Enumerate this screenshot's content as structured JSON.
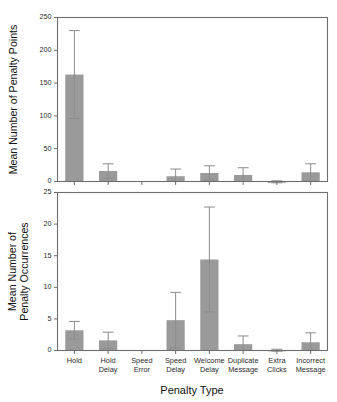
{
  "chart_data": [
    {
      "type": "bar",
      "panel": "top",
      "title": "",
      "xlabel": "",
      "ylabel": "Mean Number of Penalty Points",
      "categories": [
        "Hold",
        "Hold Delay",
        "Speed Error",
        "Speed Delay",
        "Welcome Delay",
        "Duplicate Message",
        "Extra Clicks",
        "Incorrect Message"
      ],
      "values": [
        163,
        16,
        0,
        8,
        13,
        10,
        -2,
        14
      ],
      "errors_upper": [
        230,
        27,
        0,
        19,
        24,
        21,
        1,
        27
      ],
      "ylim": [
        0,
        250
      ],
      "yticks": [
        0,
        50,
        100,
        150,
        200,
        250
      ],
      "ytick_labels": [
        "0",
        "50",
        "100",
        "150",
        "200",
        "250"
      ],
      "grid": false,
      "legend": "none",
      "bar_color": "#9a9a9a",
      "error_color": "#8c8c8c"
    },
    {
      "type": "bar",
      "panel": "bottom",
      "title": "",
      "xlabel": "Penalty Type",
      "ylabel": "Mean Number of Penalty Occurrences",
      "categories": [
        "Hold",
        "Hold Delay",
        "Speed Error",
        "Speed Delay",
        "Welcome Delay",
        "Duplicate Message",
        "Extra Clicks",
        "Incorrect Message"
      ],
      "values": [
        3.2,
        1.6,
        0,
        4.8,
        14.4,
        1.0,
        -0.1,
        1.3
      ],
      "errors_upper": [
        4.6,
        2.9,
        0,
        9.2,
        22.7,
        2.3,
        0.2,
        2.8
      ],
      "ylim": [
        0,
        25
      ],
      "yticks": [
        0,
        5,
        10,
        15,
        20,
        25
      ],
      "ytick_labels": [
        "0",
        "5",
        "10",
        "15",
        "20",
        "25"
      ],
      "grid": false,
      "legend": "none",
      "bar_color": "#9a9a9a",
      "error_color": "#8c8c8c"
    }
  ],
  "top_panel": {
    "ylabel": "Mean Number of Penalty Points",
    "ytick_labels": [
      "250",
      "200",
      "150",
      "100",
      "50",
      "0"
    ]
  },
  "bottom_panel": {
    "ylabel_line1": "Mean Number of",
    "ylabel_line2": "Penalty Occurrences",
    "ytick_labels": [
      "25",
      "20",
      "15",
      "10",
      "5",
      "0"
    ],
    "xlabel": "Penalty Type",
    "xtick_labels": [
      {
        "line1": "Hold",
        "line2": ""
      },
      {
        "line1": "Hold",
        "line2": "Delay"
      },
      {
        "line1": "Speed",
        "line2": "Error"
      },
      {
        "line1": "Speed",
        "line2": "Delay"
      },
      {
        "line1": "Welcome",
        "line2": "Delay"
      },
      {
        "line1": "Duplicate",
        "line2": "Message"
      },
      {
        "line1": "Extra",
        "line2": "Clicks"
      },
      {
        "line1": "Incorrect",
        "line2": "Message"
      }
    ]
  },
  "colors": {
    "bar": "#9a9a9a",
    "frame": "#6e6e6e",
    "error": "#8c8c8c",
    "text": "#1a1a1a",
    "background": "#ffffff"
  }
}
